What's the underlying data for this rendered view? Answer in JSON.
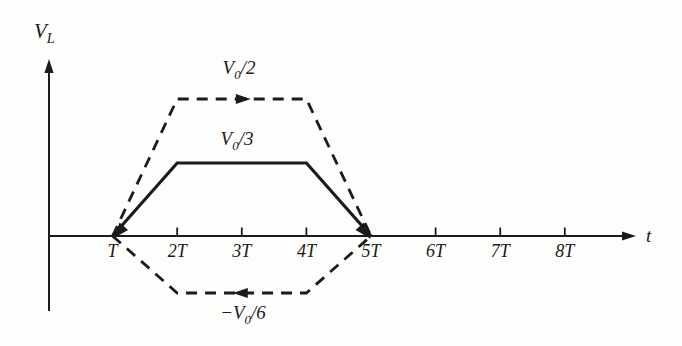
{
  "colors": {
    "ink": "#1b1b1b",
    "background": "#fdfdfb"
  },
  "chart_data": {
    "type": "line",
    "title": "",
    "xlabel": "t",
    "ylabel": "V_L",
    "x_unit": "T",
    "y_unit": "V_0",
    "grid": false,
    "x_ticks": [
      1,
      2,
      3,
      4,
      5,
      6,
      7,
      8
    ],
    "x_tick_labels": [
      "T",
      "2T",
      "3T",
      "4T",
      "5T",
      "6T",
      "7T",
      "8T"
    ],
    "ylim": [
      -0.1667,
      0.5
    ],
    "axis_labels": {
      "y": {
        "main": "V",
        "sub": "L"
      },
      "x": "t"
    },
    "series": [
      {
        "name": "upper-envelope",
        "style": "dashed",
        "amplitude": "V_0/2",
        "direction_arrow": "right",
        "x": [
          1,
          2,
          4,
          5
        ],
        "y": [
          0,
          0.5,
          0.5,
          0
        ],
        "label": {
          "main": "V",
          "sub": "0",
          "rest": "/2"
        }
      },
      {
        "name": "inductor-voltage",
        "style": "solid",
        "amplitude": "V_0/3",
        "endpoint_arrows": true,
        "x": [
          1,
          2,
          4,
          5
        ],
        "y": [
          0,
          0.3333,
          0.3333,
          0
        ],
        "label": {
          "main": "V",
          "sub": "0",
          "rest": "/3"
        }
      },
      {
        "name": "lower-envelope",
        "style": "dashed",
        "amplitude": "-V_0/6",
        "direction_arrow": "left",
        "x": [
          1,
          2,
          4,
          5
        ],
        "y": [
          0,
          -0.1667,
          -0.1667,
          0
        ],
        "label": {
          "prefix": "−",
          "main": "V",
          "sub": "0",
          "rest": "/6"
        }
      }
    ]
  }
}
